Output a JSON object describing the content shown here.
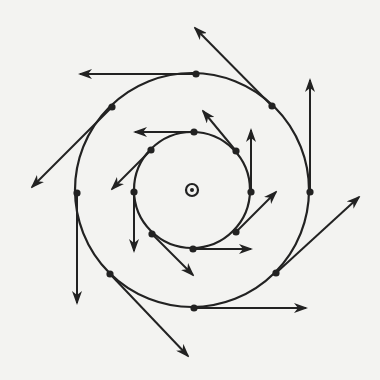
{
  "figure": {
    "description": "Two concentric circles with eight points each; arrows at each point indicate vectors circulating counter-clockwise about a central axis pointing out of the page.",
    "background_color": "#f3f3f1",
    "ink_color": "#222222",
    "center": {
      "x": 192,
      "y": 190,
      "symbol": "dot-in-circle-icon"
    },
    "circles": [
      {
        "name": "inner",
        "radius": 58
      },
      {
        "name": "outer",
        "radius": 117
      }
    ],
    "vectors": [
      {
        "circle": "inner",
        "position": "top",
        "from": [
          194,
          132
        ],
        "to": [
          135,
          132
        ]
      },
      {
        "circle": "inner",
        "position": "upper-left",
        "from": [
          151,
          150
        ],
        "to": [
          112,
          189
        ]
      },
      {
        "circle": "inner",
        "position": "left",
        "from": [
          134,
          192
        ],
        "to": [
          134,
          251
        ]
      },
      {
        "circle": "inner",
        "position": "lower-left",
        "from": [
          152,
          234
        ],
        "to": [
          193,
          275
        ]
      },
      {
        "circle": "inner",
        "position": "bottom",
        "from": [
          193,
          249
        ],
        "to": [
          251,
          249
        ]
      },
      {
        "circle": "inner",
        "position": "lower-right",
        "from": [
          236,
          232
        ],
        "to": [
          276,
          192
        ]
      },
      {
        "circle": "inner",
        "position": "right",
        "from": [
          251,
          192
        ],
        "to": [
          251,
          130
        ]
      },
      {
        "circle": "inner",
        "position": "upper-right",
        "from": [
          236,
          151
        ],
        "to": [
          203,
          111
        ]
      },
      {
        "circle": "outer",
        "position": "top",
        "from": [
          196,
          74
        ],
        "to": [
          80,
          74
        ]
      },
      {
        "circle": "outer",
        "position": "upper-left",
        "from": [
          112,
          107
        ],
        "to": [
          32,
          187
        ]
      },
      {
        "circle": "outer",
        "position": "left",
        "from": [
          77,
          193
        ],
        "to": [
          77,
          303
        ]
      },
      {
        "circle": "outer",
        "position": "lower-left",
        "from": [
          110,
          274
        ],
        "to": [
          188,
          356
        ]
      },
      {
        "circle": "outer",
        "position": "bottom",
        "from": [
          194,
          308
        ],
        "to": [
          306,
          308
        ]
      },
      {
        "circle": "outer",
        "position": "lower-right",
        "from": [
          276,
          273
        ],
        "to": [
          359,
          197
        ]
      },
      {
        "circle": "outer",
        "position": "right",
        "from": [
          310,
          192
        ],
        "to": [
          310,
          80
        ]
      },
      {
        "circle": "outer",
        "position": "upper-right",
        "from": [
          272,
          106
        ],
        "to": [
          195,
          28
        ]
      }
    ]
  }
}
